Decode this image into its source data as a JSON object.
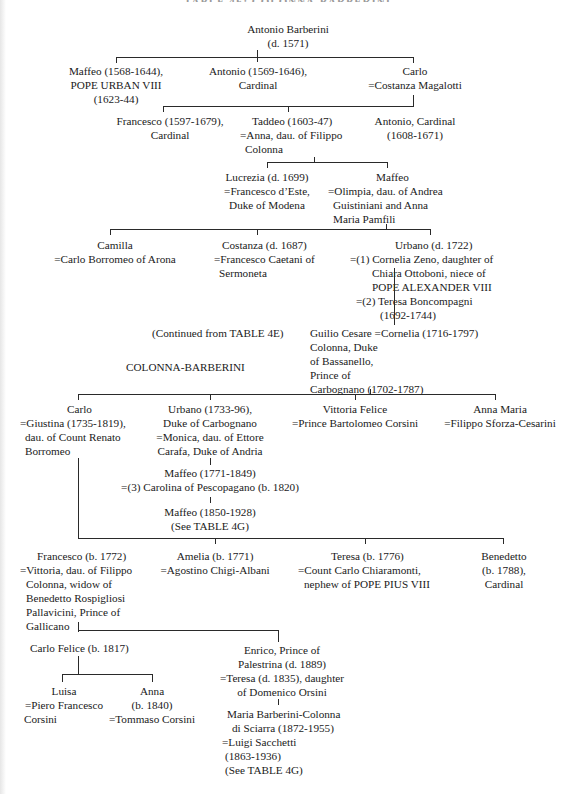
{
  "title": "TABLE 4F: COLONNA-BARBERINI",
  "notes": {
    "continued_from": "(Continued from TABLE 4E)",
    "section_label": "COLONNA-BARBERINI"
  },
  "gen1": {
    "antonio_barberini": [
      "Antonio Barberini",
      "(d. 1571)"
    ]
  },
  "gen2": {
    "maffeo": [
      "Maffeo (1568-1644),",
      "POPE URBAN VIII",
      "(1623-44)"
    ],
    "antonio": [
      "Antonio (1569-1646),",
      "Cardinal"
    ],
    "carlo": [
      "Carlo",
      "=Costanza Magalotti"
    ]
  },
  "gen3": {
    "francesco": [
      "Francesco (1597-1679),",
      "Cardinal"
    ],
    "taddeo": [
      "Taddeo (1603-47)",
      "=Anna, dau. of Filippo",
      "Colonna"
    ],
    "antonio_cardinal": [
      "Antonio, Cardinal",
      "(1608-1671)"
    ]
  },
  "gen4": {
    "lucrezia": [
      "Lucrezia (d. 1699)",
      "=Francesco d’Este,",
      "Duke of Modena"
    ],
    "maffeo": [
      "Maffeo",
      "=Olimpia, dau. of Andrea",
      "Guistiniani and Anna",
      "Maria Pamfili"
    ]
  },
  "gen5": {
    "camilla": [
      "Camilla",
      "=Carlo Borromeo of Arona"
    ],
    "costanza": [
      "Costanza (d. 1687)",
      "=Francesco Caetani of",
      "Sermoneta"
    ],
    "urbano": [
      "Urbano (d. 1722)",
      "=(1) Cornelia Zeno, daughter of",
      "Chiara Ottoboni, niece of",
      "POPE ALEXANDER VIII",
      "=(2)  Teresa Boncompagni",
      "(1692-1744)"
    ]
  },
  "gen6": {
    "guilio_cesare": [
      "Guilio Cesare =Cornelia (1716-1797)",
      "Colonna, Duke",
      "of Bassanello,",
      "Prince of",
      "Carbognano (1702-1787)"
    ]
  },
  "gen7": {
    "carlo": [
      "Carlo",
      "=Giustina (1735-1819),",
      "dau. of Count Renato",
      "Borromeo"
    ],
    "urbano": [
      "Urbano (1733-96),",
      "Duke of Carbognano",
      "=Monica, dau. of Ettore",
      "Carafa, Duke of Andria"
    ],
    "vittoria_felice": [
      "Vittoria Felice",
      "=Prince Bartolomeo Corsini"
    ],
    "anna_maria": [
      "Anna Maria",
      "=Filippo Sforza-Cesarini"
    ]
  },
  "gen8_urbano_line": {
    "maffeo_1771": [
      "Maffeo (1771-1849)",
      "=(3) Carolina of Pescopagano (b. 1820)"
    ],
    "maffeo_1850": [
      "Maffeo (1850-1928)",
      "(See TABLE 4G)"
    ]
  },
  "gen8": {
    "francesco": [
      "Francesco (b. 1772)",
      "=Vittoria, dau. of Filippo",
      "Colonna, widow of",
      "Benedetto Rospigliosi",
      "Pallavicini, Prince of",
      "Gallicano"
    ],
    "amelia": [
      "Amelia (b. 1771)",
      "=Agostino Chigi-Albani"
    ],
    "teresa": [
      "Teresa (b. 1776)",
      "=Count Carlo Chiaramonti,",
      "nephew of POPE PIUS VIII"
    ],
    "benedetto": [
      "Benedetto",
      "(b. 1788),",
      "Cardinal"
    ]
  },
  "gen9": {
    "carlo_felice": [
      "Carlo Felice (b. 1817)"
    ],
    "enrico": [
      "Enrico, Prince of",
      "Palestrina (d. 1889)",
      "=Teresa (d. 1835), daughter",
      "of Domenico Orsini"
    ]
  },
  "gen10": {
    "luisa": [
      "Luisa",
      "=Piero Francesco",
      "Corsini"
    ],
    "anna": [
      "Anna",
      "(b. 1840)",
      "=Tommaso Corsini"
    ],
    "maria": [
      "Maria Barberini-Colonna",
      "di Sciarra (1872-1955)",
      "=Luigi Sacchetti",
      "(1863-1936)",
      "(See TABLE 4G)"
    ]
  }
}
